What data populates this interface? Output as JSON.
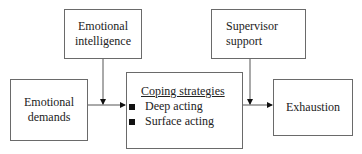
{
  "diagram": {
    "nodes": {
      "emotional_intelligence": {
        "line1": "Emotional",
        "line2": "intelligence"
      },
      "supervisor_support": {
        "line1": "Supervisor",
        "line2": "support"
      },
      "emotional_demands": {
        "line1": "Emotional",
        "line2": "demands"
      },
      "coping_strategies": {
        "title": "Coping strategies",
        "items": [
          "Deep acting",
          "Surface acting"
        ]
      },
      "exhaustion": {
        "label": "Exhaustion"
      }
    },
    "edges": [
      {
        "from": "Emotional demands",
        "to": "Coping strategies"
      },
      {
        "from": "Coping strategies",
        "to": "Exhaustion"
      },
      {
        "from": "Emotional intelligence",
        "to": "Emotional demands → Coping strategies link (moderator)"
      },
      {
        "from": "Supervisor support",
        "to": "Coping strategies → Exhaustion link (moderator)"
      }
    ]
  }
}
